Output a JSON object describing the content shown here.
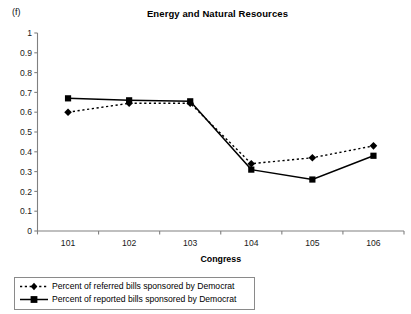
{
  "panel": {
    "label": "(f)"
  },
  "header": {
    "title": "Energy and Natural Resources"
  },
  "axes": {
    "x_title": "Congress",
    "y_ticks": [
      "0",
      "0.1",
      "0.2",
      "0.3",
      "0.4",
      "0.5",
      "0.6",
      "0.7",
      "0.8",
      "0.9",
      "1"
    ],
    "x_ticks": [
      "101",
      "102",
      "103",
      "104",
      "105",
      "106"
    ]
  },
  "legend": {
    "items": [
      {
        "label": "Percent of referred bills sponsored by Democrat",
        "style": "dotted",
        "marker": "diamond"
      },
      {
        "label": "Percent of reported bills sponsored by Democrat",
        "style": "solid",
        "marker": "square"
      }
    ]
  },
  "colors": {
    "series": "#000000",
    "axis": "#808080",
    "legend_border": "#8a8a8a",
    "background": "#ffffff"
  },
  "chart_data": {
    "type": "line",
    "title": "Energy and Natural Resources",
    "xlabel": "Congress",
    "ylabel": "",
    "categories": [
      "101",
      "102",
      "103",
      "104",
      "105",
      "106"
    ],
    "ylim": [
      0,
      1
    ],
    "ytick_step": 0.1,
    "grid": false,
    "legend_position": "below-plot",
    "series": [
      {
        "name": "Percent of referred bills sponsored by Democrat",
        "marker": "diamond",
        "line_style": "dotted",
        "values": [
          0.6,
          0.645,
          0.645,
          0.34,
          0.37,
          0.43
        ]
      },
      {
        "name": "Percent of reported bills sponsored by Democrat",
        "marker": "square",
        "line_style": "solid",
        "values": [
          0.67,
          0.66,
          0.655,
          0.31,
          0.26,
          0.38
        ]
      }
    ]
  }
}
